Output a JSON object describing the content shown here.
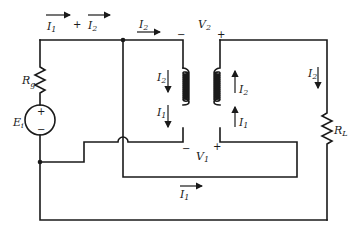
{
  "diagram": {
    "type": "transformer-circuit",
    "components": {
      "source": {
        "label": "E",
        "sub": "i",
        "plus": "+",
        "minus": "−"
      },
      "source_resistor": {
        "label": "R",
        "sub": "g"
      },
      "load_resistor": {
        "label": "R",
        "sub": "L"
      },
      "primary_winding_voltage": {
        "label": "V",
        "sub": "1",
        "plus": "+",
        "minus": "−"
      },
      "secondary_winding_voltage": {
        "label": "V",
        "sub": "2",
        "plus": "+",
        "minus": "−"
      }
    },
    "currents": {
      "top_left_I1": {
        "label": "I",
        "sub": "1"
      },
      "top_plus": "+",
      "top_left_I2": {
        "label": "I",
        "sub": "2"
      },
      "top_mid_I2": {
        "label": "I",
        "sub": "2"
      },
      "left_coil_I2": {
        "label": "I",
        "sub": "2"
      },
      "left_coil_I1": {
        "label": "I",
        "sub": "1"
      },
      "right_coil_I2": {
        "label": "I",
        "sub": "2"
      },
      "right_coil_I1": {
        "label": "I",
        "sub": "1"
      },
      "load_I2": {
        "label": "I",
        "sub": "2"
      },
      "bottom_I1": {
        "label": "I",
        "sub": "1"
      }
    }
  }
}
